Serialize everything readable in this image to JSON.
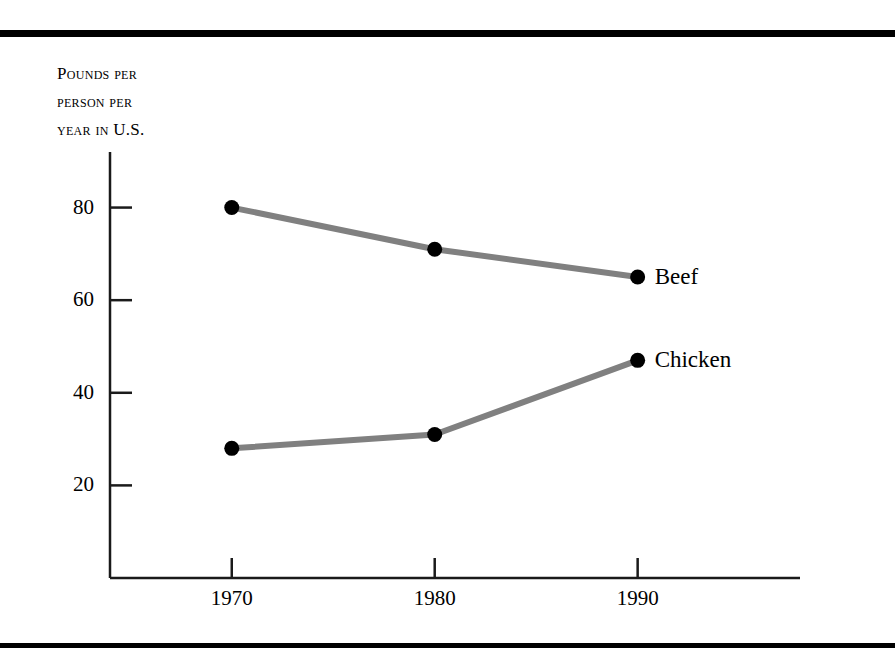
{
  "figure": {
    "name": "meat-consumption-line-chart",
    "background_color": "#ffffff",
    "rule_color": "#000000",
    "axis_color": "#1a1a1a"
  },
  "axis_caption": {
    "line1": "Pounds per",
    "line2": "person per",
    "line3": "year in U.S."
  },
  "chart_data": {
    "type": "line",
    "title": "",
    "subtitle": "",
    "xlabel": "",
    "ylabel": "Pounds per person per year in U.S.",
    "x": [
      "1970",
      "1980",
      "1990"
    ],
    "categories": [
      "1970",
      "1980",
      "1990"
    ],
    "series": [
      {
        "name": "Beef",
        "values": [
          80,
          71,
          65
        ],
        "line_color": "#808080",
        "marker_color": "#000000"
      },
      {
        "name": "Chicken",
        "values": [
          28,
          31,
          47
        ],
        "line_color": "#808080",
        "marker_color": "#000000"
      }
    ],
    "xlim": [
      1964,
      1998
    ],
    "ylim": [
      0,
      92
    ],
    "yticks": [
      20,
      40,
      60,
      80
    ],
    "ytick_labels": [
      "20",
      "40",
      "60",
      "80"
    ],
    "xticks": [
      1970,
      1980,
      1990
    ],
    "xtick_labels": [
      "1970",
      "1980",
      "1990"
    ],
    "grid": false,
    "legend": "none",
    "annotations": [
      {
        "text": "Beef",
        "at_x": "1990",
        "at_y": 65
      },
      {
        "text": "Chicken",
        "at_x": "1990",
        "at_y": 47
      }
    ]
  }
}
